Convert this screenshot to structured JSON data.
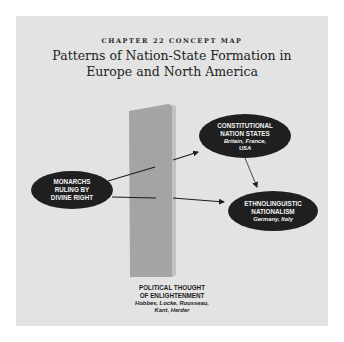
{
  "header": {
    "kicker": "CHAPTER 22 CONCEPT MAP",
    "title_line1": "Patterns of Nation-State Formation in",
    "title_line2": "Europe and North America"
  },
  "nodes": {
    "monarchs": {
      "line1": "MONARCHS",
      "line2": "RULING BY",
      "line3": "DIVINE RIGHT"
    },
    "constitutional": {
      "line1": "CONSTITUTIONAL",
      "line2": "NATION STATES",
      "sub1": "Britain, France,",
      "sub2": "USA"
    },
    "ethnolinguistic": {
      "line1": "ETHNOLINGUISTIC",
      "line2": "NATIONALISM",
      "sub1": "Germany, Italy"
    }
  },
  "pillar": {
    "line1": "POLITICAL THOUGHT",
    "line2": "OF ENLIGHTENMENT",
    "sub1": "Hobbes, Locke, Rousseau,",
    "sub2": "Kant, Herder"
  },
  "edges": [
    {
      "from": "monarchs",
      "to": "constitutional",
      "via": "pillar"
    },
    {
      "from": "monarchs",
      "to": "ethnolinguistic",
      "via": "pillar"
    },
    {
      "from": "constitutional",
      "to": "ethnolinguistic"
    }
  ],
  "colors": {
    "panel": "#e3e3e3",
    "node_fill": "#1f1f1f",
    "node_text": "#f2f2f2",
    "pillar_front": "#a4a4a4",
    "pillar_side": "#c2c2c2",
    "arrow": "#1e1e1e"
  }
}
